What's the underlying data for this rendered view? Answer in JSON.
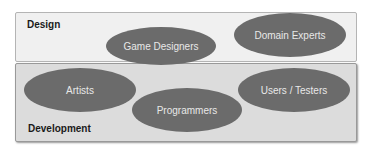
{
  "diagram": {
    "groups": [
      {
        "id": "design",
        "label": "Design"
      },
      {
        "id": "development",
        "label": "Development"
      }
    ],
    "nodes": [
      {
        "label": "Game Designers",
        "group": "design"
      },
      {
        "label": "Domain Experts",
        "group": "design"
      },
      {
        "label": "Artists",
        "group": "development"
      },
      {
        "label": "Programmers",
        "group": "development"
      },
      {
        "label": "Users / Testers",
        "group": "development"
      }
    ],
    "colors": {
      "design_bg": "#f0f0f0",
      "development_bg": "#dcdcdc",
      "node_fill": "#6b6b6b",
      "node_text": "#e8e8e8"
    }
  }
}
